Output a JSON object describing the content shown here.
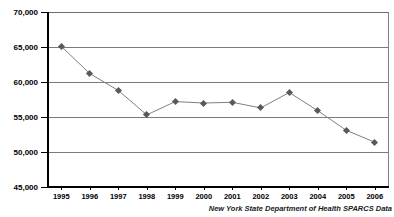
{
  "chart_data": {
    "type": "line",
    "title": "",
    "xlabel": "",
    "ylabel": "",
    "categories": [
      "1995",
      "1996",
      "1997",
      "1998",
      "1999",
      "2000",
      "2001",
      "2002",
      "2003",
      "2004",
      "2005",
      "2006"
    ],
    "values": [
      65100,
      61200,
      58800,
      55300,
      57200,
      57000,
      57100,
      56300,
      58500,
      55900,
      53100,
      51400
    ],
    "series": [
      {
        "name": "Discharges",
        "values": [
          65100,
          61200,
          58800,
          55300,
          57200,
          57000,
          57100,
          56300,
          58500,
          55900,
          53100,
          51400
        ]
      }
    ],
    "ylim": [
      45000,
      70000
    ],
    "ytick_values": [
      70000,
      65000,
      60000,
      55000,
      50000,
      45000
    ],
    "ytick_labels": [
      "70,000",
      "65,000",
      "60,000",
      "55,000",
      "50,000",
      "45,000"
    ],
    "grid": true,
    "grid_axis": "y",
    "legend": false,
    "legend_position": "none",
    "marker": "diamond",
    "line_color": "#808080",
    "marker_color": "#595959",
    "grid_color": "#7a7a7a",
    "axis_color": "#000000",
    "background": "#ffffff"
  },
  "source_note": {
    "prefix": "New York State Department of Health ",
    "emphasis": "SPARCS",
    "suffix": " Data",
    "full": "New York State Department of Health SPARCS Data"
  }
}
